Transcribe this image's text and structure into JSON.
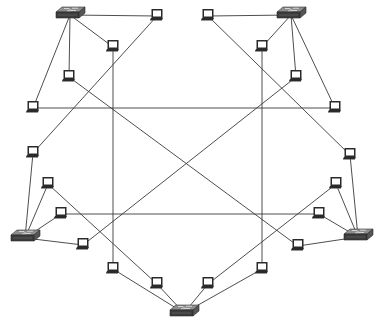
{
  "diagram": {
    "title": "",
    "colors": {
      "line": "#3a3a3a",
      "switch_top": "#8a8a8a",
      "switch_front": "#3c3c3c",
      "switch_side": "#555555",
      "laptop_body": "#2a2a2a",
      "laptop_screen": "#ffffff",
      "background": "#ffffff"
    },
    "nodes": [
      {
        "id": "S1",
        "type": "switch",
        "group": "top-left"
      },
      {
        "id": "S2",
        "type": "switch",
        "group": "top-right"
      },
      {
        "id": "S3",
        "type": "switch",
        "group": "left"
      },
      {
        "id": "S4",
        "type": "switch",
        "group": "right"
      },
      {
        "id": "S5",
        "type": "switch",
        "group": "bottom"
      },
      {
        "id": "La",
        "type": "laptop",
        "switch": "S1"
      },
      {
        "id": "Lb",
        "type": "laptop",
        "switch": "S1"
      },
      {
        "id": "Lc",
        "type": "laptop",
        "switch": "S1"
      },
      {
        "id": "Ld",
        "type": "laptop",
        "switch": "S1"
      },
      {
        "id": "Le",
        "type": "laptop",
        "switch": "S2"
      },
      {
        "id": "Lf",
        "type": "laptop",
        "switch": "S2"
      },
      {
        "id": "Lg",
        "type": "laptop",
        "switch": "S2"
      },
      {
        "id": "Lh",
        "type": "laptop",
        "switch": "S2"
      },
      {
        "id": "Li",
        "type": "laptop",
        "switch": "S3"
      },
      {
        "id": "Lj",
        "type": "laptop",
        "switch": "S3"
      },
      {
        "id": "Lk",
        "type": "laptop",
        "switch": "S3"
      },
      {
        "id": "Ll",
        "type": "laptop",
        "switch": "S3"
      },
      {
        "id": "Lm",
        "type": "laptop",
        "switch": "S4"
      },
      {
        "id": "Ln",
        "type": "laptop",
        "switch": "S4"
      },
      {
        "id": "Lo",
        "type": "laptop",
        "switch": "S4"
      },
      {
        "id": "Lp",
        "type": "laptop",
        "switch": "S4"
      },
      {
        "id": "Lq",
        "type": "laptop",
        "switch": "S5"
      },
      {
        "id": "Lr",
        "type": "laptop",
        "switch": "S5"
      },
      {
        "id": "Ls",
        "type": "laptop",
        "switch": "S5"
      },
      {
        "id": "Lt",
        "type": "laptop",
        "switch": "S5"
      }
    ],
    "edges": [
      [
        "S1",
        "La"
      ],
      [
        "S1",
        "Lb"
      ],
      [
        "S1",
        "Lc"
      ],
      [
        "S1",
        "Ld"
      ],
      [
        "S2",
        "Le"
      ],
      [
        "S2",
        "Lf"
      ],
      [
        "S2",
        "Lg"
      ],
      [
        "S2",
        "Lh"
      ],
      [
        "S3",
        "Li"
      ],
      [
        "S3",
        "Lj"
      ],
      [
        "S3",
        "Lk"
      ],
      [
        "S3",
        "Ll"
      ],
      [
        "S4",
        "Lm"
      ],
      [
        "S4",
        "Ln"
      ],
      [
        "S4",
        "Lo"
      ],
      [
        "S4",
        "Lp"
      ],
      [
        "S5",
        "Lq"
      ],
      [
        "S5",
        "Lr"
      ],
      [
        "S5",
        "Ls"
      ],
      [
        "S5",
        "Lt"
      ],
      [
        "Lb",
        "Lq"
      ],
      [
        "Lf",
        "Lt"
      ],
      [
        "Ld",
        "Lh"
      ],
      [
        "Lk",
        "Lo"
      ],
      [
        "La",
        "Li"
      ],
      [
        "Le",
        "Lm"
      ],
      [
        "Lc",
        "Lp"
      ],
      [
        "Lg",
        "Ll"
      ],
      [
        "Lj",
        "Lr"
      ],
      [
        "Ln",
        "Ls"
      ]
    ]
  }
}
